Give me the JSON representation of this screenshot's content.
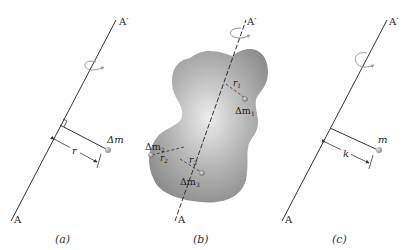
{
  "figure": {
    "panels": [
      {
        "id": "a",
        "caption": "(a)",
        "axis_top_label": "A′",
        "axis_bottom_label": "A",
        "mass_label": "Δm",
        "distance_label": "r"
      },
      {
        "id": "b",
        "caption": "(b)",
        "axis_top_label": "A′",
        "axis_bottom_label": "A",
        "masses": [
          {
            "label": "Δm",
            "sub": "1",
            "distance": "r",
            "distance_sub": "1"
          },
          {
            "label": "Δm",
            "sub": "2",
            "distance": "r",
            "distance_sub": "2"
          },
          {
            "label": "Δm",
            "sub": "3",
            "distance": "r",
            "distance_sub": "3"
          }
        ]
      },
      {
        "id": "c",
        "caption": "(c)",
        "axis_top_label": "A′",
        "axis_bottom_label": "A",
        "mass_label": "m",
        "distance_label": "k"
      }
    ],
    "colors": {
      "line": "#333333",
      "body_fill": "#9a9a9a",
      "body_highlight": "#e8e8e8",
      "mass_dot": "#a8a8a8"
    }
  }
}
